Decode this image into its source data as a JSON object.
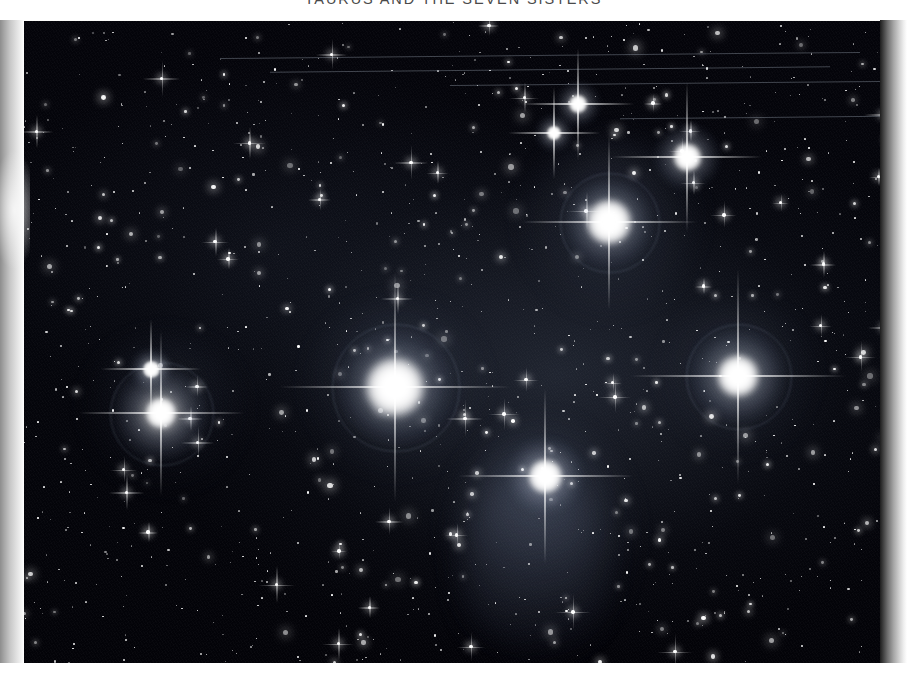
{
  "page": {
    "caption": "TAURUS AND THE SEVEN SISTERS",
    "background_color": "#ffffff",
    "plate_background_color": "#030305"
  },
  "photo": {
    "name": "pleiades-photograph",
    "subject": "Pleiades open star cluster (M45) in Taurus",
    "rendering": "monochrome halftone reproduction",
    "plate_rect": {
      "x": 20,
      "y": 21,
      "width": 866,
      "height": 644
    },
    "nebulosity_color": "#6b7a99",
    "star_color": "#ffffff"
  },
  "scan_artifacts": {
    "left_gutter_shadow": "#8d8d8d",
    "right_gutter_shadow": "#1d1d1d",
    "bottom_margin_color": "#ffffff"
  },
  "bright_stars": [
    {
      "name": "alcyone",
      "x": 375,
      "y": 366,
      "size": 58,
      "halo": 118,
      "spike": 230
    },
    {
      "name": "maia",
      "x": 589,
      "y": 201,
      "size": 44,
      "halo": 92,
      "spike": 175
    },
    {
      "name": "atlas",
      "x": 667,
      "y": 136,
      "size": 27,
      "halo": 66,
      "spike": 150
    },
    {
      "name": "electra",
      "x": 718,
      "y": 355,
      "size": 40,
      "halo": 98,
      "spike": 215
    },
    {
      "name": "merope",
      "x": 525,
      "y": 455,
      "size": 33,
      "halo": 76,
      "spike": 175
    },
    {
      "name": "taygeta",
      "x": 141,
      "y": 392,
      "size": 30,
      "halo": 96,
      "spike": 165
    },
    {
      "name": "pleione",
      "x": 131,
      "y": 348,
      "size": 17,
      "halo": 40,
      "spike": 100
    },
    {
      "name": "asterope",
      "x": 558,
      "y": 83,
      "size": 18,
      "halo": 44,
      "spike": 112
    },
    {
      "name": "celaeno",
      "x": 534,
      "y": 112,
      "size": 14,
      "halo": 36,
      "spike": 92
    }
  ],
  "nebulae": [
    {
      "name": "merope-nebula",
      "x": 520,
      "y": 520,
      "width": 185,
      "height": 230,
      "opacity": 0.2
    },
    {
      "name": "maia-nebula",
      "x": 590,
      "y": 205,
      "width": 175,
      "height": 170,
      "opacity": 0.17
    },
    {
      "name": "alcyone-nebula",
      "x": 375,
      "y": 368,
      "width": 175,
      "height": 165,
      "opacity": 0.13
    },
    {
      "name": "electra-nebula",
      "x": 718,
      "y": 358,
      "width": 150,
      "height": 145,
      "opacity": 0.11
    },
    {
      "name": "taygeta-nebula",
      "x": 145,
      "y": 392,
      "width": 160,
      "height": 150,
      "opacity": 0.1
    }
  ]
}
